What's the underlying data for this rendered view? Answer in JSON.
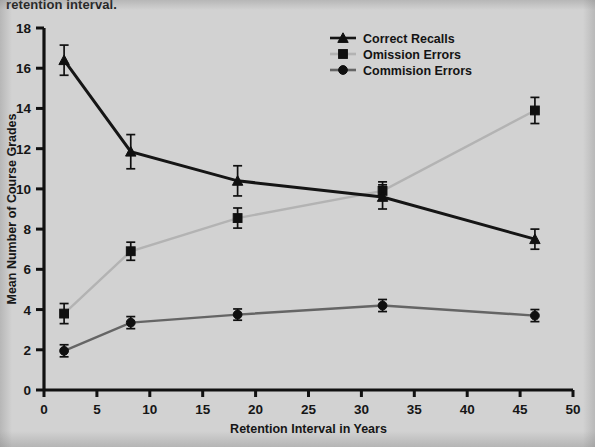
{
  "caption_fragment": "retention interval.",
  "colors": {
    "background": "#d2d2d2",
    "axis": "#111111",
    "correct_recalls": "#151515",
    "omission_errors": "#b3b3b3",
    "commision_errors": "#656565",
    "error_bar": "#101010"
  },
  "legend": {
    "position": "top-right",
    "entries": [
      {
        "label": "Correct Recalls",
        "marker": "triangle-marker",
        "color": "#151515"
      },
      {
        "label": "Omission Errors",
        "marker": "square-marker",
        "color": "#b3b3b3"
      },
      {
        "label": "Commision Errors",
        "marker": "circle-marker",
        "color": "#656565"
      }
    ]
  },
  "chart_data": {
    "type": "line",
    "title": "",
    "xlabel": "Retention Interval in Years",
    "ylabel": "Mean Number of Course Grades",
    "xlim": [
      0,
      50
    ],
    "ylim": [
      0,
      18
    ],
    "xticks": [
      0,
      5,
      10,
      15,
      20,
      25,
      30,
      35,
      40,
      45,
      50
    ],
    "yticks": [
      0,
      2,
      4,
      6,
      8,
      10,
      12,
      14,
      16,
      18
    ],
    "xtick_labels": [
      "0",
      "5",
      "10",
      "15",
      "20",
      "25",
      "30",
      "35",
      "40",
      "45",
      "50"
    ],
    "ytick_labels": [
      "0",
      "2",
      "4",
      "6",
      "8",
      "10",
      "12",
      "14",
      "16",
      "18"
    ],
    "grid": false,
    "legend_position": "upper right",
    "x": [
      1.9,
      8.2,
      18.3,
      32.0,
      46.4
    ],
    "series": [
      {
        "name": "Correct Recalls",
        "marker": "triangle",
        "color": "#151515",
        "values": [
          16.4,
          11.85,
          10.4,
          9.6,
          7.5
        ],
        "errors": [
          0.75,
          0.85,
          0.75,
          0.6,
          0.5
        ]
      },
      {
        "name": "Omission Errors",
        "marker": "square",
        "color": "#b3b3b3",
        "values": [
          3.8,
          6.9,
          8.55,
          9.9,
          13.9
        ],
        "errors": [
          0.5,
          0.45,
          0.5,
          0.45,
          0.65
        ]
      },
      {
        "name": "Commision Errors",
        "marker": "circle",
        "color": "#656565",
        "values": [
          1.95,
          3.35,
          3.75,
          4.2,
          3.7
        ],
        "errors": [
          0.3,
          0.3,
          0.28,
          0.3,
          0.3
        ]
      }
    ]
  }
}
